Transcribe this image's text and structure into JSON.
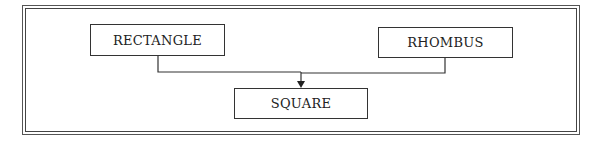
{
  "diagram": {
    "nodes": [
      {
        "id": "rectangle",
        "label": "RECTANGLE"
      },
      {
        "id": "rhombus",
        "label": "RHOMBUS"
      },
      {
        "id": "square",
        "label": "SQUARE"
      }
    ],
    "edges": [
      {
        "from": "rectangle",
        "to": "square"
      },
      {
        "from": "rhombus",
        "to": "square"
      }
    ],
    "colors": {
      "line": "#333333",
      "frame": "#555555",
      "background": "#ffffff"
    }
  }
}
